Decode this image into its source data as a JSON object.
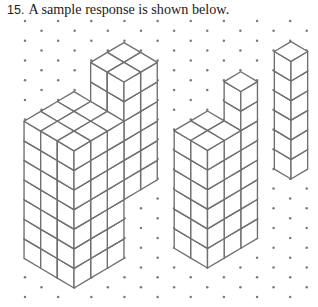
{
  "caption": {
    "number": "15.",
    "text": "A sample response is shown below."
  },
  "figure": {
    "colors": {
      "line": "#6f6f6f",
      "dot": "#7a7a7a",
      "face_fill": "#ffffff"
    },
    "iso": {
      "edge_dx": 16.65,
      "edge_dy": 9.86,
      "vertical": 19.6
    },
    "dot_grid": {
      "y_start": 21,
      "row_spacing": 9.86,
      "rows": 29,
      "even_row_x_start": 25,
      "odd_row_x_start": 41.5,
      "col_spacing": 33.15,
      "x_max": 310,
      "dot_radius": 1.25
    },
    "structures": [
      {
        "name": "left-structure",
        "origin": [
          74,
          288
        ],
        "blocks": [
          {
            "a": [
              3,
              5
            ],
            "b": [
              0,
              2
            ],
            "c": [
              3,
              9
            ]
          },
          {
            "a": [
              0,
              3
            ],
            "b": [
              0,
              3
            ],
            "c": [
              0,
              7
            ]
          }
        ]
      },
      {
        "name": "middle-structure",
        "origin": [
          207.5,
          268
        ],
        "blocks": [
          {
            "a": [
              2,
              3
            ],
            "b": [
              0,
              1
            ],
            "c": [
              0,
              8
            ]
          },
          {
            "a": [
              0,
              2
            ],
            "b": [
              0,
              2
            ],
            "c": [
              0,
              6
            ]
          }
        ]
      },
      {
        "name": "right-structure",
        "origin": [
          291,
          179
        ],
        "blocks": [
          {
            "a": [
              0,
              1
            ],
            "b": [
              0,
              1
            ],
            "c": [
              0,
              6
            ]
          }
        ]
      }
    ]
  }
}
